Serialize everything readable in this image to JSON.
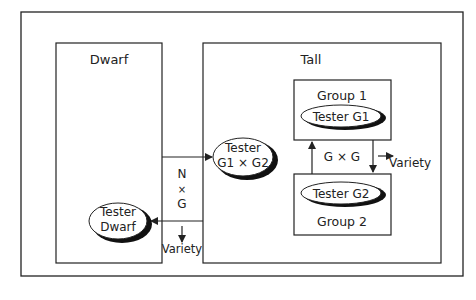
{
  "diagram": {
    "dwarf": {
      "label": "Dwarf",
      "tester": {
        "line1": "Tester",
        "line2": "Dwarf"
      }
    },
    "tall": {
      "label": "Tall",
      "tester": {
        "line1": "Tester",
        "line2": "G1 × G2"
      },
      "group1": {
        "label": "Group 1",
        "tester": "Tester G1"
      },
      "group2": {
        "label": "Group 2",
        "tester": "Tester G2"
      },
      "gxg": "G × G",
      "gxg_output": "Variety"
    },
    "nxg": {
      "line1": "N",
      "line2": "×",
      "line3": "G",
      "output": "Variety"
    }
  },
  "colors": {
    "line": "#222222",
    "background": "#ffffff"
  }
}
